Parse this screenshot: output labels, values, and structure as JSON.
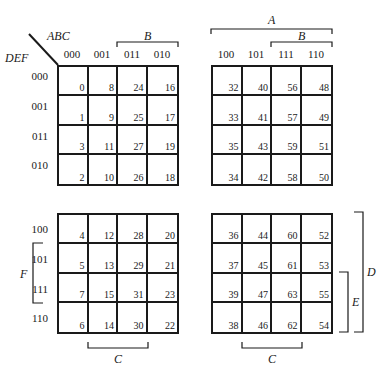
{
  "diagram": {
    "type": "karnaugh-map-6-variable",
    "corner": {
      "column_vars": "ABC",
      "row_vars": "DEF"
    },
    "column_labels_left": [
      "000",
      "001",
      "011",
      "010"
    ],
    "column_labels_right": [
      "100",
      "101",
      "111",
      "110"
    ],
    "row_labels_top": [
      "000",
      "001",
      "011",
      "010"
    ],
    "row_labels_bottom": [
      "100",
      "101",
      "111",
      "110"
    ],
    "brackets": {
      "A": "A",
      "B_left": "B",
      "B_right": "B",
      "C_left": "C",
      "C_right": "C",
      "D": "D",
      "E": "E",
      "F": "F"
    },
    "maps": {
      "top_left": [
        [
          "0",
          "8",
          "24",
          "16"
        ],
        [
          "1",
          "9",
          "25",
          "17"
        ],
        [
          "3",
          "11",
          "27",
          "19"
        ],
        [
          "2",
          "10",
          "26",
          "18"
        ]
      ],
      "top_right": [
        [
          "32",
          "40",
          "56",
          "48"
        ],
        [
          "33",
          "41",
          "57",
          "49"
        ],
        [
          "35",
          "43",
          "59",
          "51"
        ],
        [
          "34",
          "42",
          "58",
          "50"
        ]
      ],
      "bottom_left": [
        [
          "4",
          "12",
          "28",
          "20"
        ],
        [
          "5",
          "13",
          "29",
          "21"
        ],
        [
          "7",
          "15",
          "31",
          "23"
        ],
        [
          "6",
          "14",
          "30",
          "22"
        ]
      ],
      "bottom_right": [
        [
          "36",
          "44",
          "60",
          "52"
        ],
        [
          "37",
          "45",
          "61",
          "53"
        ],
        [
          "39",
          "47",
          "63",
          "55"
        ],
        [
          "38",
          "46",
          "62",
          "54"
        ]
      ]
    }
  }
}
